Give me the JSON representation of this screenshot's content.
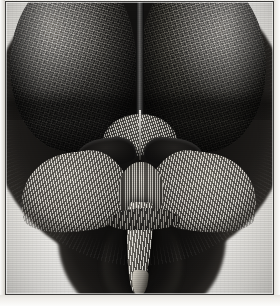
{
  "plate": {
    "title": "Engraved plate: head of a fly (frontal view)",
    "medium": "copperplate engraving on laid paper",
    "caption": "",
    "border": {
      "style": "single thin rule",
      "color": "#3e3d3b",
      "paper_color": "#f2f1ee"
    }
  },
  "figure": {
    "orientation": "frontal",
    "parts": [
      {
        "id": "eye-left",
        "label": "left compound eye",
        "texture": "hexagonal ommatidia lattice"
      },
      {
        "id": "eye-right",
        "label": "right compound eye",
        "texture": "hexagonal ommatidia lattice"
      },
      {
        "id": "eye-suture",
        "label": "vertex suture between eyes",
        "texture": "fine parallel hatching"
      },
      {
        "id": "vertex-tuft",
        "label": "vertex bristles",
        "texture": "fine vertical bristles"
      },
      {
        "id": "lunule",
        "label": "lunule / frontal plate",
        "texture": "radiating hatching"
      },
      {
        "id": "antenna-left",
        "label": "left antenna",
        "texture": "solid dark ink"
      },
      {
        "id": "antenna-right",
        "label": "right antenna",
        "texture": "solid dark ink"
      },
      {
        "id": "palp-left",
        "label": "left maxillary palp",
        "texture": "fine hair hatching"
      },
      {
        "id": "palp-right",
        "label": "right maxillary palp",
        "texture": "fine hair hatching"
      },
      {
        "id": "clypeus",
        "label": "clypeus",
        "texture": "vertical hatching"
      },
      {
        "id": "proboscis",
        "label": "proboscis",
        "texture": "longitudinal hatching"
      },
      {
        "id": "proboscis-band",
        "label": "labellum band",
        "texture": "cross hatching"
      },
      {
        "id": "proboscis-tip",
        "label": "proboscis tip",
        "texture": "highlight"
      },
      {
        "id": "head-halo",
        "label": "hairy head outline",
        "texture": "dense stipple"
      },
      {
        "id": "neck-halo",
        "label": "thorax shadow",
        "texture": "dense stipple"
      },
      {
        "id": "tail-halo",
        "label": "lower shadow",
        "texture": "dense stipple"
      }
    ],
    "colors": {
      "ink_dark": "#0c0b0a",
      "ink_mid": "#4c4a46",
      "highlight": "#e7e3d9",
      "paper": "#f2f1ee"
    }
  }
}
